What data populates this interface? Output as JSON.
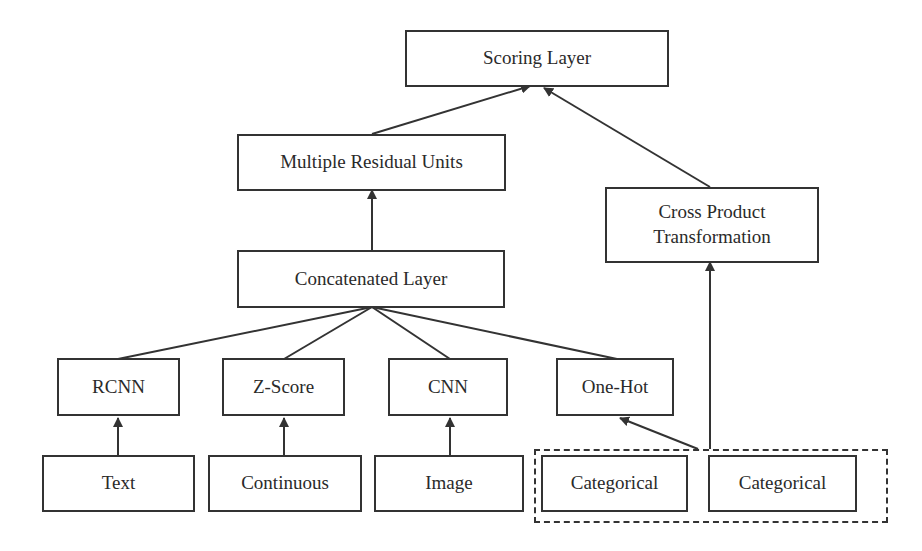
{
  "diagram": {
    "nodes": {
      "scoring": "Scoring Layer",
      "residual": "Multiple Residual Units",
      "cross": "Cross Product Transformation",
      "concat": "Concatenated Layer",
      "rcnn": "RCNN",
      "zscore": "Z-Score",
      "cnn": "CNN",
      "onehot": "One-Hot",
      "text": "Text",
      "continuous": "Continuous",
      "image": "Image",
      "categorical1": "Categorical",
      "categorical2": "Categorical"
    },
    "edges": [
      {
        "from": "Text",
        "to": "RCNN"
      },
      {
        "from": "Continuous",
        "to": "Z-Score"
      },
      {
        "from": "Image",
        "to": "CNN"
      },
      {
        "from": "Categorical group",
        "to": "One-Hot"
      },
      {
        "from": "Categorical group",
        "to": "Cross Product Transformation"
      },
      {
        "from": "RCNN",
        "to": "Concatenated Layer"
      },
      {
        "from": "Z-Score",
        "to": "Concatenated Layer"
      },
      {
        "from": "CNN",
        "to": "Concatenated Layer"
      },
      {
        "from": "One-Hot",
        "to": "Concatenated Layer"
      },
      {
        "from": "Concatenated Layer",
        "to": "Multiple Residual Units"
      },
      {
        "from": "Multiple Residual Units",
        "to": "Scoring Layer"
      },
      {
        "from": "Cross Product Transformation",
        "to": "Scoring Layer"
      }
    ],
    "colors": {
      "stroke": "#333333",
      "background": "#ffffff",
      "text": "#2a2a2a"
    }
  }
}
